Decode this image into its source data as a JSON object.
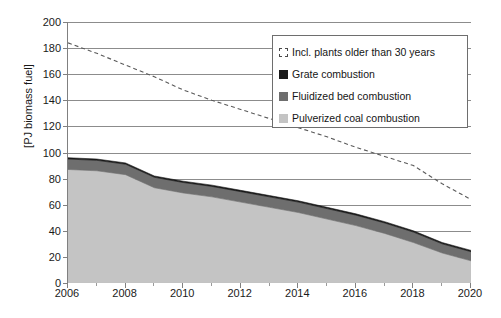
{
  "chart_data": {
    "type": "area",
    "title": "",
    "xlabel": "",
    "ylabel": "[PJ biomass fuel]",
    "xlim": [
      2006,
      2020
    ],
    "ylim": [
      0,
      200
    ],
    "ytick_values": [
      0,
      20,
      40,
      60,
      80,
      100,
      120,
      140,
      160,
      180,
      200
    ],
    "ytick_labels": [
      "0",
      "20",
      "40",
      "60",
      "80",
      "100",
      "120",
      "140",
      "160",
      "180",
      "200"
    ],
    "xtick_values": [
      2006,
      2008,
      2010,
      2012,
      2014,
      2016,
      2018,
      2020
    ],
    "xtick_labels": [
      "2006",
      "2008",
      "2010",
      "2012",
      "2014",
      "2016",
      "2018",
      "2020"
    ],
    "x": [
      2006,
      2007,
      2008,
      2009,
      2010,
      2011,
      2012,
      2013,
      2014,
      2015,
      2016,
      2017,
      2018,
      2019,
      2020
    ],
    "grid": true,
    "legend_position": "upper right",
    "stacked": true,
    "series": [
      {
        "name": "Pulverized coal combustion",
        "kind": "area",
        "color": "#c4c4c4",
        "values": [
          87,
          86,
          83,
          73,
          69,
          66,
          62,
          58,
          54,
          49,
          44,
          38,
          31,
          23,
          17
        ]
      },
      {
        "name": "Fluidized bed combustion",
        "kind": "area",
        "color": "#6e6e6e",
        "values": [
          8,
          8,
          8,
          8,
          8,
          8,
          8,
          8,
          8,
          8,
          8,
          8,
          8,
          7,
          7
        ]
      },
      {
        "name": "Grate combustion",
        "kind": "area",
        "color": "#1a1a1a",
        "values": [
          1,
          1,
          1,
          1,
          1,
          1,
          1,
          1,
          1,
          1,
          1,
          1,
          1,
          1,
          1
        ]
      },
      {
        "name": "Incl. plants older than 30 years",
        "kind": "dashed-line",
        "color": "#5a5a5a",
        "values": [
          184,
          176,
          167,
          158,
          148,
          140,
          133,
          126,
          119,
          112,
          104,
          97,
          90,
          76,
          64
        ]
      }
    ]
  },
  "axes": {
    "ylabel": "[PJ biomass fuel]"
  },
  "legend": {
    "items": [
      {
        "label": "Incl. plants older than 30 years",
        "marker": "dashed-square-marker",
        "color": "#ffffff"
      },
      {
        "label": "Grate combustion",
        "marker": "filled-square-marker",
        "color": "#1a1a1a"
      },
      {
        "label": "Fluidized bed combustion",
        "marker": "filled-square-marker",
        "color": "#6e6e6e"
      },
      {
        "label": "Pulverized coal combustion",
        "marker": "filled-square-marker",
        "color": "#c4c4c4"
      }
    ]
  }
}
